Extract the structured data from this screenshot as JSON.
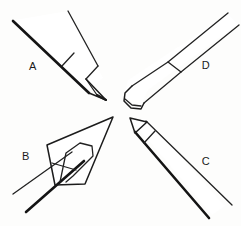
{
  "figure": {
    "background_color": "#fdfdfc",
    "line_color": "#1c1c1c",
    "width": 241,
    "height": 226
  },
  "objects": [
    {
      "id": "a",
      "label": "A",
      "label_x": 33,
      "label_y": 70,
      "description": "Pencil in upper-left, shaft running from top-left down to a sharpened conical tip pointing toward center-right",
      "orientation": "upper-left",
      "tip_style": "sharpened-cone",
      "view": "side"
    },
    {
      "id": "b",
      "label": "B",
      "label_x": 25,
      "label_y": 160,
      "description": "Pencil in lower-left seen in strong foreshortening, the sharpened cone appearing as a wide triangle with a rounded inner loop, shaft crossing down to lower-left",
      "orientation": "lower-left",
      "tip_style": "foreshortened-cone",
      "view": "end-on-oblique"
    },
    {
      "id": "c",
      "label": "C",
      "label_x": 205,
      "label_y": 165,
      "description": "Pencil in lower-right, shaft running from bottom-right corner up to a sharpened conical tip pointing toward center-left",
      "orientation": "lower-right",
      "tip_style": "sharpened-cone",
      "view": "side"
    },
    {
      "id": "d",
      "label": "D",
      "label_x": 205,
      "label_y": 69,
      "description": "Pencil in upper-right shown unsharpened, the thick body tapering from top-right down to a blunt flat chisel end facing center-left",
      "orientation": "upper-right",
      "tip_style": "blunt-flat-end",
      "view": "side"
    }
  ],
  "labels": {
    "a": "A",
    "b": "B",
    "c": "C",
    "d": "D"
  }
}
